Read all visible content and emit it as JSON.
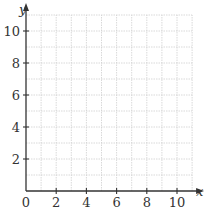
{
  "chart_data": {
    "type": "scatter",
    "title": "",
    "xlabel": "x",
    "ylabel": "y",
    "xlim": [
      0,
      11
    ],
    "ylim": [
      0,
      11
    ],
    "x_ticks": [
      0,
      2,
      4,
      6,
      8,
      10
    ],
    "y_ticks": [
      2,
      4,
      6,
      8,
      10
    ],
    "x_tick_labels": [
      "0",
      "2",
      "4",
      "6",
      "8",
      "10"
    ],
    "y_tick_labels": [
      "2",
      "4",
      "6",
      "8",
      "10"
    ],
    "grid": true,
    "grid_step": 1,
    "series": [],
    "colors": {
      "axis": "#333333",
      "grid": "#cfcfcf"
    }
  }
}
